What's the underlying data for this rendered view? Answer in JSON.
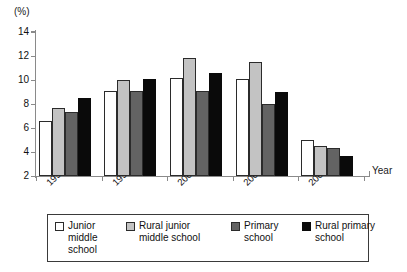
{
  "chart_data": {
    "type": "bar",
    "title": "",
    "subtitle": "",
    "xlabel": "Year",
    "ylabel": "(%)",
    "unit_label": "(%)",
    "categories": [
      "1994",
      "1997",
      "2000",
      "2003",
      "2006"
    ],
    "series": [
      {
        "name": "Junior middle school",
        "color": "#ffffff",
        "swatch": "c-white",
        "values": [
          6.6,
          9.1,
          10.2,
          10.1,
          5.0
        ]
      },
      {
        "name": "Rural junior middle school",
        "color": "#c3c3c3",
        "swatch": "c-light",
        "values": [
          7.7,
          10.0,
          11.8,
          11.5,
          4.5
        ]
      },
      {
        "name": "Primary school",
        "color": "#636363",
        "swatch": "c-dark",
        "values": [
          7.3,
          9.1,
          9.1,
          8.0,
          4.3
        ]
      },
      {
        "name": "Rural primary school",
        "color": "#0a0a0a",
        "swatch": "c-black",
        "values": [
          8.5,
          10.1,
          10.6,
          9.0,
          3.7
        ]
      }
    ],
    "ylim": [
      2,
      14
    ],
    "yticks": [
      2,
      4,
      6,
      8,
      10,
      12,
      14
    ],
    "ytick_labels": [
      "2",
      "4",
      "6",
      "8",
      "10",
      "12",
      "14"
    ],
    "grid": false,
    "legend_position": "bottom"
  },
  "legend": {
    "items": [
      {
        "label_line1": "Junior",
        "label_line2": "middle",
        "label_line3": "school",
        "swatch": "c-white"
      },
      {
        "label_line1": "Rural junior",
        "label_line2": "middle school",
        "label_line3": "",
        "swatch": "c-light"
      },
      {
        "label_line1": "Primary",
        "label_line2": "school",
        "label_line3": "",
        "swatch": "c-dark"
      },
      {
        "label_line1": "Rural primary",
        "label_line2": "school",
        "label_line3": "",
        "swatch": "c-black"
      }
    ]
  },
  "axes": {
    "y_unit": "(%)",
    "x_axis_name": "Year"
  }
}
